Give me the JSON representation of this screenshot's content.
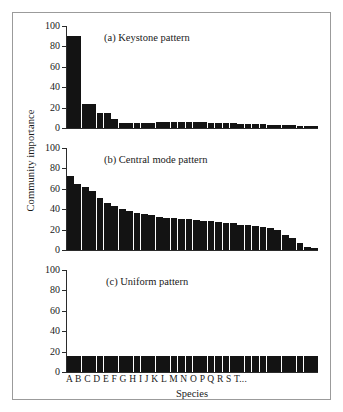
{
  "figure": {
    "background_color": "#ffffff",
    "frame_color": "#9b9b9b",
    "bar_color": "#131313",
    "axis_color": "#2b2b2b",
    "ylabel": "Community importance",
    "xlabel": "Species",
    "xticklabels": "A B C D E F G H I  J K L M N O P Q R S T..."
  },
  "chart_data": [
    {
      "type": "bar",
      "title": "(a) Keystone pattern",
      "xlabel": "Species",
      "ylabel": "Community importance",
      "ylim": [
        0,
        100
      ],
      "yticks": [
        0,
        20,
        40,
        60,
        80,
        100
      ],
      "grid": false,
      "legend": "none",
      "categories": [
        "A",
        "B",
        "C",
        "D",
        "E",
        "F",
        "G",
        "H",
        "I",
        "J",
        "K",
        "L",
        "M",
        "N",
        "O",
        "P",
        "Q",
        "R",
        "S",
        "T",
        "U",
        "V",
        "W",
        "X",
        "Y",
        "Z",
        "AA",
        "AB",
        "AC",
        "AD",
        "AE",
        "AF",
        "AG",
        "AH"
      ],
      "values": [
        90,
        90,
        24,
        24,
        15,
        15,
        9,
        5,
        5,
        5,
        5,
        5,
        6,
        6,
        6,
        6,
        6,
        6,
        6,
        5,
        5,
        5,
        5,
        4,
        4,
        4,
        4,
        3,
        3,
        3,
        3,
        2,
        2,
        2
      ]
    },
    {
      "type": "bar",
      "title": "(b) Central mode pattern",
      "xlabel": "Species",
      "ylabel": "Community importance",
      "ylim": [
        0,
        100
      ],
      "yticks": [
        0,
        20,
        40,
        60,
        80,
        100
      ],
      "grid": false,
      "legend": "none",
      "categories": [
        "A",
        "B",
        "C",
        "D",
        "E",
        "F",
        "G",
        "H",
        "I",
        "J",
        "K",
        "L",
        "M",
        "N",
        "O",
        "P",
        "Q",
        "R",
        "S",
        "T",
        "U",
        "V",
        "W",
        "X",
        "Y",
        "Z",
        "AA",
        "AB",
        "AC",
        "AD",
        "AE",
        "AF",
        "AG",
        "AH"
      ],
      "values": [
        73,
        65,
        62,
        58,
        51,
        46,
        43,
        40,
        38,
        36,
        35,
        34,
        32,
        31,
        31,
        30,
        30,
        29,
        28,
        28,
        27,
        26,
        26,
        25,
        25,
        24,
        23,
        22,
        20,
        15,
        12,
        7,
        3,
        2
      ]
    },
    {
      "type": "bar",
      "title": "(c) Uniform pattern",
      "xlabel": "Species",
      "ylabel": "Community importance",
      "ylim": [
        0,
        100
      ],
      "yticks": [
        0,
        20,
        40,
        60,
        80,
        100
      ],
      "grid": false,
      "legend": "none",
      "categories": [
        "A",
        "B",
        "C",
        "D",
        "E",
        "F",
        "G",
        "H",
        "I",
        "J",
        "K",
        "L",
        "M",
        "N",
        "O",
        "P",
        "Q",
        "R",
        "S",
        "T",
        "U",
        "V",
        "W",
        "X",
        "Y",
        "Z",
        "AA",
        "AB",
        "AC",
        "AD",
        "AE",
        "AF",
        "AG",
        "AH"
      ],
      "values": [
        16,
        16,
        16,
        16,
        16,
        16,
        16,
        16,
        16,
        16,
        16,
        16,
        16,
        16,
        16,
        16,
        16,
        16,
        16,
        16,
        16,
        16,
        16,
        16,
        16,
        16,
        16,
        16,
        16,
        16,
        16,
        16,
        16,
        16
      ]
    }
  ]
}
